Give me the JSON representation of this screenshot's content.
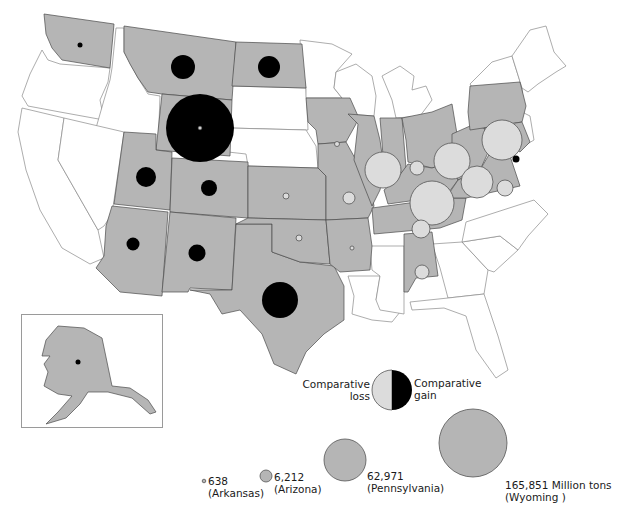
{
  "map": {
    "type": "proportional-symbol",
    "subject": "Coal production by state",
    "colors": {
      "producing_state": "#b5b5b5",
      "non_producing_state": "#ffffff",
      "comparative_gain": "#000000",
      "comparative_loss": "#dcdcdc"
    }
  },
  "legend": {
    "comparison": {
      "loss_label_line1": "Comparative",
      "loss_label_line2": "loss",
      "gain_label_line1": "Comparative",
      "gain_label_line2": "gain"
    },
    "sizes": [
      {
        "value": "638",
        "state": "(Arkansas)"
      },
      {
        "value": "6,212",
        "state": "(Arizona)"
      },
      {
        "value": "62,971",
        "state": "(Pennsylvania)"
      },
      {
        "value": "165,851 Million tons",
        "state": "(Wyoming )"
      }
    ]
  },
  "symbols": [
    {
      "state": "Washington",
      "type": "gain",
      "size": "tiny"
    },
    {
      "state": "Montana",
      "type": "gain",
      "size": "medium"
    },
    {
      "state": "North Dakota",
      "type": "gain",
      "size": "medium"
    },
    {
      "state": "Wyoming",
      "type": "gain",
      "size": "largest"
    },
    {
      "state": "Utah",
      "type": "gain",
      "size": "small"
    },
    {
      "state": "Colorado",
      "type": "gain",
      "size": "small"
    },
    {
      "state": "Arizona",
      "type": "gain",
      "size": "small"
    },
    {
      "state": "New Mexico",
      "type": "gain",
      "size": "small"
    },
    {
      "state": "Texas",
      "type": "gain",
      "size": "large"
    },
    {
      "state": "Maryland",
      "type": "gain",
      "size": "tiny"
    },
    {
      "state": "Alaska",
      "type": "gain",
      "size": "tiny"
    },
    {
      "state": "Kansas",
      "type": "loss",
      "size": "tiny"
    },
    {
      "state": "Oklahoma",
      "type": "loss",
      "size": "tiny"
    },
    {
      "state": "Arkansas",
      "type": "loss",
      "size": "tiny"
    },
    {
      "state": "Iowa",
      "type": "loss",
      "size": "tiny"
    },
    {
      "state": "Missouri",
      "type": "loss",
      "size": "small"
    },
    {
      "state": "Illinois",
      "type": "loss",
      "size": "large"
    },
    {
      "state": "Indiana",
      "type": "loss",
      "size": "small"
    },
    {
      "state": "Ohio",
      "type": "loss",
      "size": "large"
    },
    {
      "state": "Pennsylvania",
      "type": "loss",
      "size": "large"
    },
    {
      "state": "West Virginia",
      "type": "loss",
      "size": "large"
    },
    {
      "state": "Kentucky",
      "type": "loss",
      "size": "large"
    },
    {
      "state": "Virginia",
      "type": "loss",
      "size": "small"
    },
    {
      "state": "Tennessee",
      "type": "loss",
      "size": "small"
    },
    {
      "state": "Alabama",
      "type": "loss",
      "size": "small"
    }
  ]
}
